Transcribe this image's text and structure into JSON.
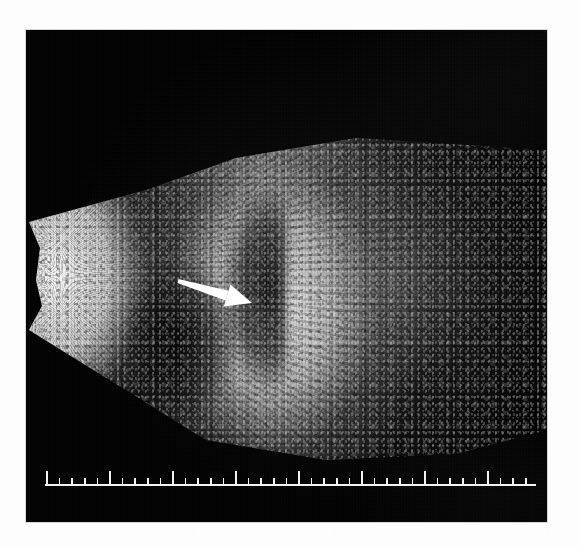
{
  "figure": {
    "kind": "medical-ultrasound-b-mode",
    "modality": "B-mode ultrasonography",
    "orientation": "sector scan, apex at left, depth increasing to the right"
  },
  "panel": {
    "background_color": "#010101",
    "border_color": "#d8d8d8",
    "x": 26,
    "y": 30,
    "width": 521,
    "height": 492
  },
  "page": {
    "background_color": "#fdfdfd"
  },
  "sector": {
    "label": "ultrasound-sector",
    "apex_side": "left",
    "fill_tone": "grayscale speckle",
    "bright_regions": [
      {
        "name": "near-field-bright-wedge",
        "position": "left edge",
        "tone": "very bright"
      },
      {
        "name": "central-hyperechoic-mass",
        "position": "center, arrow target",
        "tone": "bright"
      },
      {
        "name": "upper-echo-band",
        "position": "upper middle",
        "tone": "medium"
      }
    ],
    "dark_regions": [
      {
        "name": "anechoic-crescent",
        "position": "left of central mass",
        "tone": "near-black"
      },
      {
        "name": "far-field-attenuation",
        "position": "right side",
        "tone": "fading to black"
      }
    ]
  },
  "arrow": {
    "label": "pointer-arrow",
    "color": "#ffffff",
    "direction": "right-and-slightly-down",
    "tail_x": 178,
    "tail_y": 281,
    "tip_x": 252,
    "tip_y": 303,
    "points_at": "central-hyperechoic-mass"
  },
  "scale_ruler": {
    "label": "depth-scale-ruler",
    "color": "#f2f2f2",
    "baseline_y": 485,
    "start_x": 47,
    "end_x": 536,
    "minor_tick_spacing_px": 12.6,
    "minor_tick_height_px": 7,
    "major_tick_height_px": 14,
    "major_every_n_ticks": 5,
    "minor_tick_count": 39,
    "units": "uncalibrated depth graticule"
  }
}
